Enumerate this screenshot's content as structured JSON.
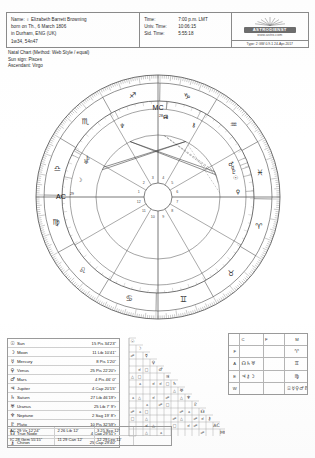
{
  "header": {
    "name_line": "Name:  ♀  Elizabeth Barrett Browning",
    "born_line": "born on Th., 6 March 1806",
    "place_line": "in Durham, ENG (UK)",
    "coord_line": "1w34, 54n47",
    "time_rows": [
      {
        "label": "Time:",
        "value": "7:00 p.m. LMT"
      },
      {
        "label": "Univ. Time:",
        "value": "10:06:15"
      },
      {
        "label": "Sid. Time:",
        "value": "5:55:18"
      }
    ],
    "logo_name": "ASTRODIENST",
    "logo_url": "www.astro.com",
    "logo_footer": "Type: 2 GW   0.9-1  24-Apr-2017"
  },
  "subtitle": {
    "line1": "Natal Chart  (Method: Web Style / equal)",
    "line2": "Sun sign: Pisces",
    "line3": "Ascendant: Virgo"
  },
  "wheel": {
    "mc_label": "MC",
    "mc_degree": "28",
    "ac_label": "AC",
    "ac_degree": "29",
    "signs": [
      {
        "name": "aries",
        "glyph": "♈"
      },
      {
        "name": "taurus",
        "glyph": "♉"
      },
      {
        "name": "gemini",
        "glyph": "♊"
      },
      {
        "name": "cancer",
        "glyph": "♋"
      },
      {
        "name": "leo",
        "glyph": "♌"
      },
      {
        "name": "virgo",
        "glyph": "♍"
      },
      {
        "name": "libra",
        "glyph": "♎"
      },
      {
        "name": "scorpio",
        "glyph": "♏"
      },
      {
        "name": "sagittarius",
        "glyph": "♐"
      },
      {
        "name": "capricorn",
        "glyph": "♑"
      },
      {
        "name": "aquarius",
        "glyph": "♒"
      },
      {
        "name": "pisces",
        "glyph": "♓"
      }
    ],
    "house_numbers": [
      "1",
      "2",
      "3",
      "4",
      "5",
      "6",
      "7",
      "8",
      "9",
      "10",
      "11",
      "12"
    ]
  },
  "planets": [
    {
      "glyph": "☉",
      "name": "Sun",
      "position": "15 Pis 34'23\""
    },
    {
      "glyph": "☽",
      "name": "Moon",
      "position": "11 Lib 10'41\""
    },
    {
      "glyph": "☿",
      "name": "Mercury",
      "position": "8 Pis   1'20\""
    },
    {
      "glyph": "♀",
      "name": "Venus",
      "position": "25 Pis 22'20\"r"
    },
    {
      "glyph": "♂",
      "name": "Mars",
      "position": "4 Pis 46'  0\""
    },
    {
      "glyph": "♃",
      "name": "Jupiter",
      "position": "4 Cap 20'15\""
    },
    {
      "glyph": "♄",
      "name": "Saturn",
      "position": "27 Lib 46'19\"r"
    },
    {
      "glyph": "♅",
      "name": "Uranus",
      "position": "25 Lib  7'  9\"r"
    },
    {
      "glyph": "♆",
      "name": "Neptune",
      "position": "2 Sag 19'  8\"r"
    },
    {
      "glyph": "♇",
      "name": "Pluto",
      "position": "10 Pis 32'59\"r"
    },
    {
      "glyph": "☊",
      "name": "True Node",
      "position": "4 Cap 29'51\"r"
    },
    {
      "glyph": "⚷",
      "name": "Chiron",
      "position": "25 Cap 29'40\""
    }
  ],
  "cusps": [
    [
      {
        "glyph": "AC",
        "value": "29  Vir  12'24\""
      },
      {
        "value": "2 26  Lib  12'"
      },
      {
        "value": "3 25 Sco 12'"
      }
    ],
    [
      {
        "glyph": "IC",
        "value": "28 Gem 55'15\""
      },
      {
        "value": "11 29  Can  12'"
      },
      {
        "value": "12 29 Leo 12'"
      }
    ]
  ],
  "elements": {
    "col_headers": [
      "",
      "C",
      "F",
      "M"
    ],
    "rows": [
      {
        "label": "F",
        "cells": [
          "",
          "",
          "♈"
        ]
      },
      {
        "label": "A",
        "cells": [
          "☊♄♅",
          "",
          "♊"
        ]
      },
      {
        "label": "E",
        "cells": [
          "♃⚷☽",
          "",
          "♍"
        ]
      },
      {
        "label": "W",
        "cells": [
          "",
          "",
          "☉☿♀♂♇♆"
        ]
      }
    ]
  },
  "aspect_grid": {
    "diagonal_glyphs": [
      "☉",
      "☽",
      "☿",
      "♀",
      "♂",
      "♃",
      "♄",
      "♅",
      "♆",
      "♇",
      "☊",
      "⚷",
      "AC",
      "MC"
    ],
    "aspect_symbols": [
      "□",
      "△",
      "☍",
      "⚹",
      "☌"
    ]
  }
}
